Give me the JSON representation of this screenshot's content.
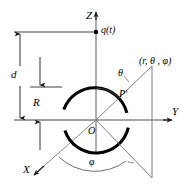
{
  "figure": {
    "type": "geometry-diagram",
    "background_color": "#ffffff",
    "stroke_color": "#000000",
    "axis_color": "#808080",
    "thin_line_color": "#7a7a7a",
    "sphere_stroke_color": "#000000",
    "labels": {
      "axis_z": "Z",
      "axis_y": "Y",
      "axis_x": "X",
      "origin": "O",
      "charge": "q(t)",
      "distance_d": "d",
      "radius_R": "R",
      "angle_theta": "θ",
      "angle_phi": "φ",
      "field_point_prime": "Pʹ",
      "coordinates": "(r, θ , φ)"
    },
    "geometry": {
      "origin": {
        "x": 96,
        "y": 120
      },
      "sphere_radius_px": 33,
      "charge_point": {
        "x": 96,
        "y": 32
      },
      "distance_d_span": {
        "top_y": 32,
        "bottom_y": 87
      },
      "radius_R_span": {
        "top_y": 87,
        "bottom_y": 120
      },
      "field_point": {
        "x": 152,
        "y": 70
      },
      "projection_point": {
        "x": 152,
        "y": 177
      },
      "z_axis": {
        "x1": 96,
        "y1": 12,
        "x2": 96,
        "y2": 152
      },
      "y_axis": {
        "x1": 96,
        "y1": 120,
        "x2": 178,
        "y2": 120
      },
      "x_axis": {
        "x1": 96,
        "y1": 120,
        "x2": 30,
        "y2": 178
      },
      "theta_arc_radius_px": 32,
      "phi_arc_radius_px": 52
    }
  }
}
